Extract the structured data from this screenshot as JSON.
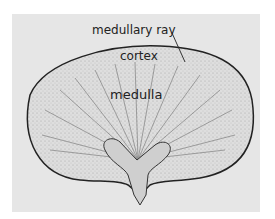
{
  "figure": {
    "labels": {
      "medullary_ray": "medullary ray",
      "cortex": "cortex",
      "medulla": "medulla"
    },
    "colors": {
      "background": "#e6e6e6",
      "outline": "#222222",
      "cortex_fill": "#d8d8d8",
      "pelvis_fill": "#cfcfcf"
    }
  }
}
